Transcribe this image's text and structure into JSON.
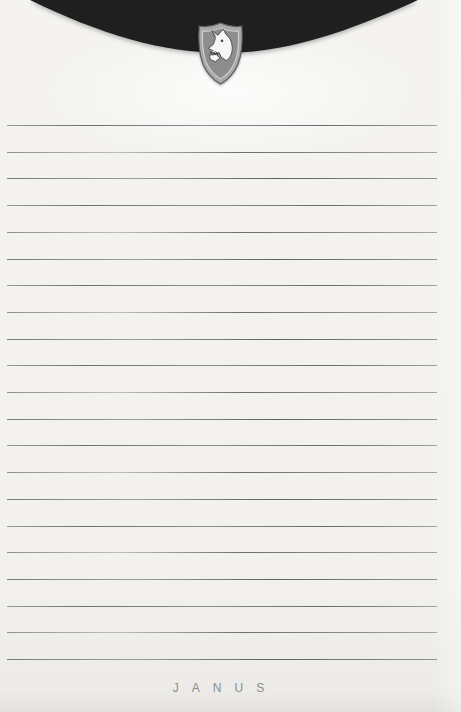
{
  "colors": {
    "paper": "#f2f1ee",
    "flap": "#1f1f1f",
    "brand": "#8c8c8c",
    "shield_band": "#a9a9a9",
    "shield_body": "#8d8d8d",
    "shield_edge": "#5e5e5e",
    "shield_keyline": "#d6d6d6",
    "wolf_fill": "#f6f6f5",
    "wolf_line": "#4a4a4a"
  },
  "header": {
    "flap_shape": "curved-envelope-flap",
    "emblem": "wolf-head-shield"
  },
  "notepad": {
    "line_count": 21,
    "first_line_y": 125,
    "line_spacing": 26.7,
    "line_left": 7,
    "line_width": 430
  },
  "footer": {
    "brand": "JANUS"
  }
}
